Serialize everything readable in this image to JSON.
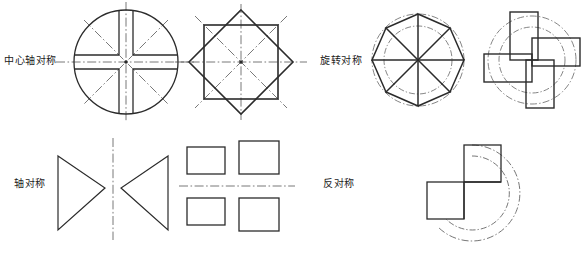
{
  "page": {
    "background_color": "#ffffff",
    "line_color": "#2b2b2b",
    "centerline_color": "#555555",
    "width": 587,
    "height": 253
  },
  "rows": [
    {
      "id": "row-top",
      "labels": [
        {
          "id": "central-axis-symmetry",
          "text": "中心轴对称",
          "x": 4,
          "y": 52
        },
        {
          "id": "rotational-symmetry",
          "text": "旋转对称",
          "x": 320,
          "y": 52
        }
      ],
      "figures": [
        {
          "id": "circle-with-cross-slot",
          "name": "circle-cross-slot",
          "caption": ""
        },
        {
          "id": "octagram-two-squares",
          "name": "octagram-two-squares",
          "caption": ""
        },
        {
          "id": "pinwheel-eight-blades",
          "name": "pinwheel-eight-blades",
          "caption": ""
        },
        {
          "id": "pinwheel-four-rectangles",
          "name": "pinwheel-four-rectangles",
          "caption": ""
        }
      ]
    },
    {
      "id": "row-bottom",
      "labels": [
        {
          "id": "axial-symmetry",
          "text": "轴对称",
          "x": 14,
          "y": 175
        },
        {
          "id": "anti-symmetry",
          "text": "反对称",
          "x": 323,
          "y": 175
        }
      ],
      "figures": [
        {
          "id": "mirrored-triangles",
          "name": "mirrored-triangles",
          "caption": ""
        },
        {
          "id": "mirrored-rectangles",
          "name": "mirrored-rectangles",
          "caption": ""
        },
        {
          "id": "l-shape-with-arcs",
          "name": "l-shape-with-arcs",
          "caption": ""
        }
      ]
    }
  ],
  "legend": {
    "solid_line_meaning": "轮廓线",
    "dash_dot_line_meaning": "中心线"
  }
}
